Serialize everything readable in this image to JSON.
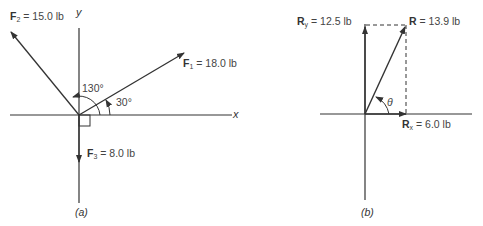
{
  "panel_a": {
    "caption": "(a)",
    "x_axis": "x",
    "y_axis": "y",
    "forces": [
      {
        "name": "F",
        "sub": "1",
        "value": "= 18.0 lb"
      },
      {
        "name": "F",
        "sub": "2",
        "value": "= 15.0 lb"
      },
      {
        "name": "F",
        "sub": "3",
        "value": "= 8.0 lb"
      }
    ],
    "angles": [
      "130°",
      "30°"
    ]
  },
  "panel_b": {
    "caption": "(b)",
    "components": [
      {
        "name": "R",
        "sub": "y",
        "value": "= 12.5 lb"
      },
      {
        "name": "R",
        "sub": "x",
        "value": "= 6.0 lb"
      }
    ],
    "resultant": {
      "name": "R",
      "value": "= 13.9 lb"
    },
    "angle": "θ"
  },
  "colors": {
    "line": "#333333",
    "text": "#444444",
    "background": "#ffffff"
  }
}
